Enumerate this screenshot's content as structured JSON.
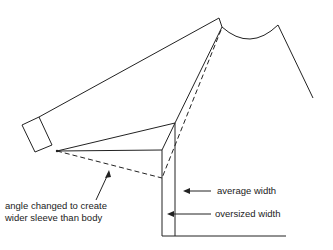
{
  "diagram": {
    "annotations": {
      "angle_note_line1": "angle changed to create",
      "angle_note_line2": "wider sleeve than body",
      "average_width": "average width",
      "oversized_width": "oversized width"
    },
    "colors": {
      "line": "#222222",
      "background": "#ffffff"
    }
  }
}
